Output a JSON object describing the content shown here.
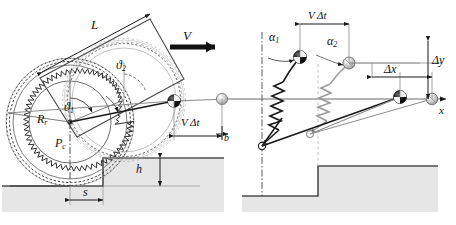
{
  "figure": {
    "width": 456,
    "height": 225,
    "background": "#ffffff"
  },
  "colors": {
    "ink": "#1a1a1a",
    "gray_line": "#8d8d8d",
    "light_gray_line": "#b5b5b5",
    "terrain_fill": "#e6e6e6",
    "terrain_edge": "#4d4d4d",
    "ball_dark": "#111111",
    "ball_light": "#c9c9c9"
  },
  "left_panel": {
    "name": "wheel-step-geometry",
    "labels": {
      "arm_length": "L",
      "velocity": "V",
      "theta1": "ϑ1",
      "theta2": "ϑ2",
      "wheel_radius": "Rr",
      "wheel_center": "Pc",
      "travel": "V Δt",
      "body_offset": "b",
      "step_height": "h",
      "step_distance": "s"
    },
    "label_parts": {
      "theta1_base": "ϑ",
      "theta1_sub": "1",
      "theta2_base": "ϑ",
      "theta2_sub": "2",
      "Rr_base": "R",
      "Rr_sub": "r",
      "Pc_base": "P",
      "Pc_sub": "c",
      "travel_v": "V",
      "travel_dt": "Δt"
    }
  },
  "right_panel": {
    "name": "spring-mass-equivalent",
    "labels": {
      "alpha1": "α1",
      "alpha2": "α2",
      "travel": "V Δt",
      "delta_x": "Δx",
      "delta_y": "Δy",
      "x_axis": "x"
    },
    "label_parts": {
      "alpha1_base": "α",
      "alpha1_sub": "1",
      "alpha2_base": "α",
      "alpha2_sub": "2",
      "travel_v": "V",
      "travel_dt": "Δt",
      "dx": "Δx",
      "dy": "Δy",
      "x": "x"
    }
  }
}
